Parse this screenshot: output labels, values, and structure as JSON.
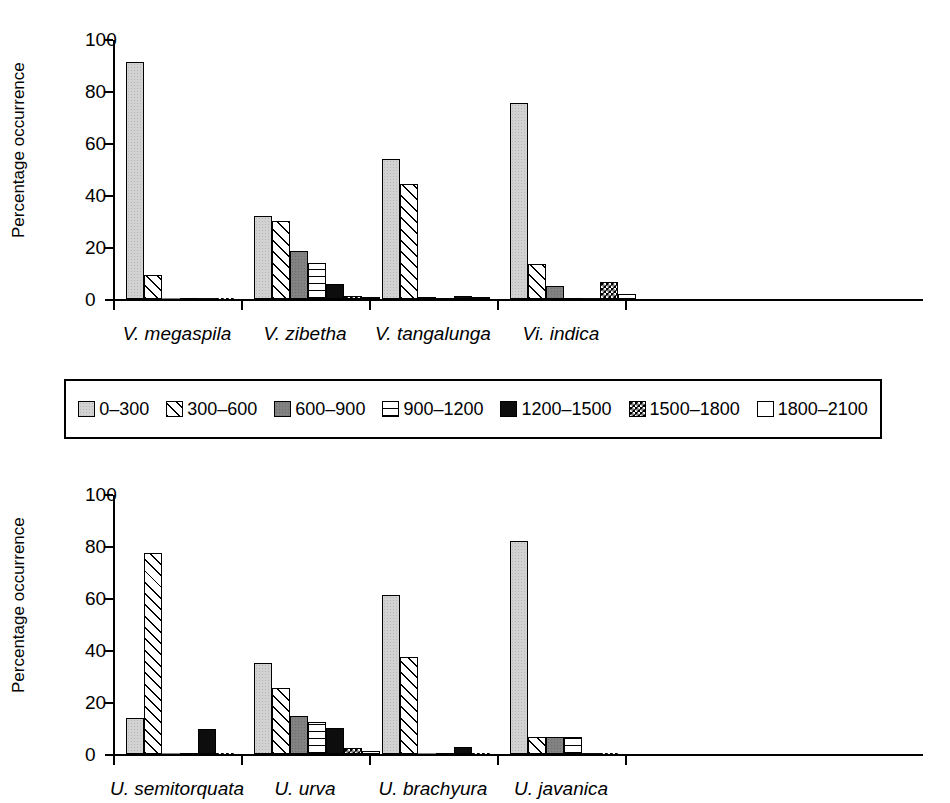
{
  "figure": {
    "y_axis_label": "Percentage occurrence",
    "y_ticks": [
      "0",
      "20",
      "40",
      "60",
      "80",
      "100"
    ],
    "legend_title": "",
    "legend": [
      {
        "label": "0–300",
        "pattern": "light-grey-stipple",
        "color": "#d2d2d2"
      },
      {
        "label": "300–600",
        "pattern": "diagonal-hatch",
        "color": "#ffffff"
      },
      {
        "label": "600–900",
        "pattern": "dark-grey-solid",
        "color": "#828282"
      },
      {
        "label": "900–1200",
        "pattern": "horizontal-lines",
        "color": "#ffffff"
      },
      {
        "label": "1200–1500",
        "pattern": "solid-black",
        "color": "#0d0d0d"
      },
      {
        "label": "1500–1800",
        "pattern": "checkered",
        "color": "#000000"
      },
      {
        "label": "1800–2100",
        "pattern": "white-empty",
        "color": "#ffffff"
      }
    ]
  },
  "chart_data": [
    {
      "type": "bar",
      "id": "top",
      "title": "",
      "xlabel": "",
      "ylabel": "Percentage occurrence",
      "ylim": [
        0,
        100
      ],
      "yticks": [
        0,
        20,
        40,
        60,
        80,
        100
      ],
      "grid": false,
      "legend_position": "below-between-panels",
      "categories": [
        "V. megaspila",
        "V. zibetha",
        "V. tangalunga",
        "Vi. indica"
      ],
      "series": [
        {
          "name": "0–300",
          "values": [
            91.0,
            31.8,
            54.0,
            75.5
          ]
        },
        {
          "name": "300–600",
          "values": [
            9.3,
            30.0,
            44.2,
            13.5
          ]
        },
        {
          "name": "600–900",
          "values": [
            0,
            18.5,
            0.7,
            5.0
          ]
        },
        {
          "name": "900–1200",
          "values": [
            0,
            13.7,
            0,
            0
          ]
        },
        {
          "name": "1200–1500",
          "values": [
            0,
            5.9,
            1.1,
            0
          ]
        },
        {
          "name": "1500–1800",
          "values": [
            0,
            1.3,
            0.7,
            6.5
          ]
        },
        {
          "name": "1800–2100",
          "values": [
            0,
            0.8,
            0,
            2.0
          ]
        }
      ]
    },
    {
      "type": "bar",
      "id": "bottom",
      "title": "",
      "xlabel": "",
      "ylabel": "Percentage occurrence",
      "ylim": [
        0,
        100
      ],
      "yticks": [
        0,
        20,
        40,
        60,
        80,
        100
      ],
      "grid": false,
      "legend_position": "above-between-panels",
      "categories": [
        "U. semitorquata",
        "U. urva",
        "U. brachyura",
        "U. javanica"
      ],
      "series": [
        {
          "name": "0–300",
          "values": [
            14.0,
            35.0,
            61.0,
            82.0
          ]
        },
        {
          "name": "300–600",
          "values": [
            77.5,
            25.2,
            37.2,
            6.5
          ]
        },
        {
          "name": "600–900",
          "values": [
            0,
            14.5,
            0,
            6.5
          ]
        },
        {
          "name": "900–1200",
          "values": [
            0,
            12.5,
            0,
            6.5
          ]
        },
        {
          "name": "1200–1500",
          "values": [
            9.5,
            10.0,
            2.8,
            0
          ]
        },
        {
          "name": "1500–1800",
          "values": [
            0,
            2.5,
            0,
            0
          ]
        },
        {
          "name": "1800–2100",
          "values": [
            0,
            1.2,
            0,
            0
          ]
        }
      ]
    }
  ]
}
